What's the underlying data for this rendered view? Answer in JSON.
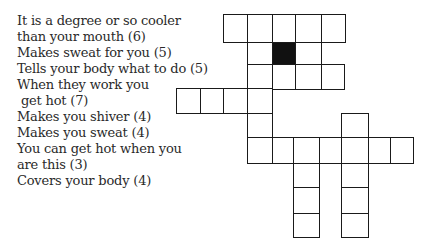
{
  "clues": [
    {
      "lines": [
        "It is a degree or so cooler",
        "than your mouth (6)"
      ]
    },
    {
      "lines": [
        "Makes sweat for you (5)"
      ]
    },
    {
      "lines": [
        "Tells your body what to do (5)"
      ]
    },
    {
      "lines": [
        "When they work you",
        "get hot (7)"
      ]
    },
    {
      "lines": [
        "Makes you shiver (4)"
      ]
    },
    {
      "lines": [
        "Makes you sweat (4)"
      ]
    },
    {
      "lines": [
        "You can get hot when you",
        "are this (3)"
      ]
    },
    {
      "lines": [
        "Covers your body (4)"
      ]
    }
  ],
  "grid": {
    "cells": [
      {
        "x": 223,
        "y": 14,
        "w": 24,
        "h": 28
      },
      {
        "x": 247,
        "y": 14,
        "w": 25,
        "h": 28
      },
      {
        "x": 272,
        "y": 14,
        "w": 23,
        "h": 28
      },
      {
        "x": 295,
        "y": 14,
        "w": 26,
        "h": 28
      },
      {
        "x": 321,
        "y": 14,
        "w": 24,
        "h": 28
      },
      {
        "x": 247,
        "y": 42,
        "w": 25,
        "h": 22
      },
      {
        "x": 272,
        "y": 42,
        "w": 23,
        "h": 22,
        "black": true
      },
      {
        "x": 295,
        "y": 42,
        "w": 26,
        "h": 22
      },
      {
        "x": 247,
        "y": 64,
        "w": 25,
        "h": 25
      },
      {
        "x": 272,
        "y": 64,
        "w": 23,
        "h": 25
      },
      {
        "x": 295,
        "y": 64,
        "w": 26,
        "h": 25
      },
      {
        "x": 321,
        "y": 64,
        "w": 23,
        "h": 25
      },
      {
        "x": 176,
        "y": 88,
        "w": 24,
        "h": 25
      },
      {
        "x": 200,
        "y": 88,
        "w": 23,
        "h": 25
      },
      {
        "x": 223,
        "y": 88,
        "w": 24,
        "h": 25
      },
      {
        "x": 247,
        "y": 88,
        "w": 25,
        "h": 25
      },
      {
        "x": 247,
        "y": 113,
        "w": 25,
        "h": 24
      },
      {
        "x": 341,
        "y": 113,
        "w": 27,
        "h": 24
      },
      {
        "x": 247,
        "y": 137,
        "w": 25,
        "h": 26
      },
      {
        "x": 272,
        "y": 137,
        "w": 21,
        "h": 26
      },
      {
        "x": 293,
        "y": 137,
        "w": 26,
        "h": 26
      },
      {
        "x": 319,
        "y": 137,
        "w": 22,
        "h": 26
      },
      {
        "x": 341,
        "y": 137,
        "w": 27,
        "h": 26
      },
      {
        "x": 368,
        "y": 137,
        "w": 22,
        "h": 26
      },
      {
        "x": 390,
        "y": 137,
        "w": 23,
        "h": 26
      },
      {
        "x": 293,
        "y": 163,
        "w": 26,
        "h": 24
      },
      {
        "x": 341,
        "y": 163,
        "w": 27,
        "h": 24
      },
      {
        "x": 293,
        "y": 187,
        "w": 26,
        "h": 26
      },
      {
        "x": 341,
        "y": 187,
        "w": 27,
        "h": 26
      },
      {
        "x": 293,
        "y": 213,
        "w": 26,
        "h": 24
      },
      {
        "x": 341,
        "y": 213,
        "w": 27,
        "h": 24
      }
    ]
  }
}
